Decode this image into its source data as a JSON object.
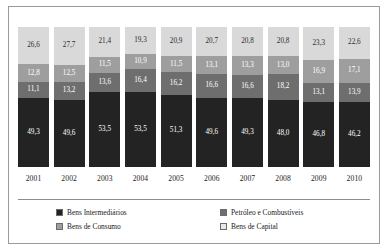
{
  "chart_data": {
    "type": "bar",
    "stacked": true,
    "title": "",
    "subtitle": "",
    "xlabel": "",
    "ylabel": "",
    "ylim": [
      0,
      100
    ],
    "grid": false,
    "legend_position": "bottom",
    "decimal_separator": ",",
    "categories": [
      "2001",
      "2002",
      "2003",
      "2004",
      "2005",
      "2006",
      "2007",
      "2008",
      "2009",
      "2010"
    ],
    "series": [
      {
        "name": "Bens Intermediários",
        "color": "#232323",
        "values": [
          49.3,
          49.6,
          53.5,
          53.5,
          51.3,
          49.6,
          49.3,
          48.0,
          46.8,
          46.2
        ],
        "labels": [
          "49,3",
          "49,6",
          "53,5",
          "53,5",
          "51,3",
          "49,6",
          "49,3",
          "48,0",
          "46,8",
          "46,2"
        ]
      },
      {
        "name": "Petróleo e Combustíveis",
        "color": "#6e6e6e",
        "values": [
          11.1,
          13.2,
          13.6,
          16.4,
          16.2,
          16.6,
          16.6,
          18.2,
          13.1,
          13.9
        ],
        "labels": [
          "11,1",
          "13,2",
          "13,6",
          "16,4",
          "16,2",
          "16,6",
          "16,6",
          "18,2",
          "13,1",
          "13,9"
        ]
      },
      {
        "name": "Bens de Consumo",
        "color": "#9e9e9e",
        "values": [
          12.8,
          12.5,
          11.5,
          10.9,
          11.5,
          13.1,
          13.3,
          13.0,
          16.9,
          17.1
        ],
        "labels": [
          "12,8",
          "12,5",
          "11,5",
          "10,9",
          "11,5",
          "13,1",
          "13,3",
          "13,0",
          "16,9",
          "17,1"
        ]
      },
      {
        "name": "Bens de Capital",
        "color": "#d9d9d9",
        "values": [
          26.6,
          27.7,
          21.4,
          19.3,
          20.9,
          20.7,
          20.8,
          20.8,
          23.3,
          22.6
        ],
        "labels": [
          "26,6",
          "27,7",
          "21,4",
          "19,3",
          "20,9",
          "20,7",
          "20,8",
          "20,8",
          "23,3",
          "22,6"
        ]
      }
    ]
  },
  "legend": {
    "items": [
      {
        "label": "Bens Intermediários",
        "swatch": "sw-interm"
      },
      {
        "label": "Petróleo e Combustíveis",
        "swatch": "sw-petroleo"
      },
      {
        "label": "Bens de Consumo",
        "swatch": "sw-consumo"
      },
      {
        "label": "Bens de Capital",
        "swatch": "sw-capital"
      }
    ]
  }
}
